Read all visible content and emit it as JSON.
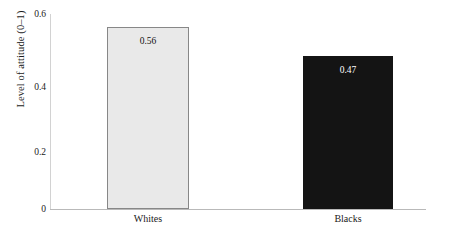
{
  "chart_data": {
    "type": "bar",
    "title": "",
    "subtitle": "",
    "xlabel": "",
    "ylabel": "Level of attitude (0–1)",
    "categories": [
      "Whites",
      "Blacks"
    ],
    "values": [
      0.56,
      0.47
    ],
    "value_labels": [
      "0.56",
      "0.47"
    ],
    "ylim": [
      0,
      0.6
    ],
    "ytick_labels": [
      "0",
      "0.2",
      "0.4",
      "0.6"
    ],
    "ytick_values": [
      0,
      0.2,
      0.4,
      0.6
    ],
    "grid": false,
    "legend": false,
    "legend_position": "none",
    "series": [
      {
        "name": "Level of attitude",
        "values": [
          0.56,
          0.47
        ]
      }
    ],
    "bar_styles": [
      {
        "category": "Whites",
        "fill": "#e9e9e9",
        "border": "#878787",
        "label_color": "#111111"
      },
      {
        "category": "Blacks",
        "fill": "#141414",
        "border": "#141414",
        "label_color": "#ffffff"
      }
    ],
    "colors": {
      "background": "#ffffff",
      "axis": "#b9b9b9",
      "text": "#1a1a1a"
    }
  }
}
